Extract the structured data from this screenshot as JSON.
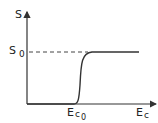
{
  "diagram": {
    "y_axis_label": "S",
    "x_axis_label_main": "E",
    "x_axis_label_sub": "c",
    "level_label_main": "S",
    "level_label_sub": "0",
    "threshold_label_main": "E",
    "threshold_label_sub": "c",
    "threshold_label_sub2": "0",
    "curve_description": "sigmoid step: S = 0 for Ec < Ec0, rises sharply at Ec0 to saturate at S0",
    "line_color": "#333333"
  }
}
